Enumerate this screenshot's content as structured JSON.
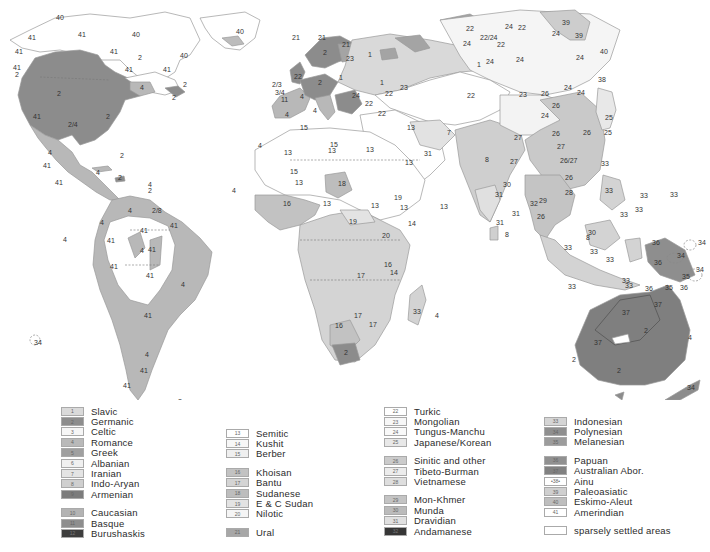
{
  "map": {
    "title": "World languages map",
    "colors": {
      "c1": "#d9d9d9",
      "c2": "#8c8c8c",
      "c3": "#f4f4f4",
      "c4": "#b8b8b8",
      "c5": "#9e9e9e",
      "c6": "#efefef",
      "c7": "#e2e2e2",
      "c8": "#cfcfcf",
      "c9": "#7a7a7a",
      "c10": "#b0b0b0",
      "c11": "#8a8a8a",
      "c12": "#3c3c3c",
      "white": "#ffffff",
      "light": "#e9e9e9",
      "mid": "#c6c6c6",
      "c21": "#a4a4a4",
      "c26": "#c9c9c9",
      "c32": "#353535",
      "c33": "#d3d3d3",
      "c34": "#8d8d8d",
      "c35": "#9a9a9a",
      "c36": "#8e8e8e",
      "c37": "#7f7f7f",
      "c39": "#cdcdcd",
      "c40": "#bcbcbc"
    },
    "labels": [
      {
        "t": "40",
        "x": 56,
        "y": 20
      },
      {
        "t": "41",
        "x": 28,
        "y": 40
      },
      {
        "t": "41",
        "x": 78,
        "y": 37
      },
      {
        "t": "40",
        "x": 132,
        "y": 37
      },
      {
        "t": "40",
        "x": 180,
        "y": 58
      },
      {
        "t": "41",
        "x": 110,
        "y": 54
      },
      {
        "t": "41",
        "x": 15,
        "y": 54
      },
      {
        "t": "41",
        "x": 125,
        "y": 72
      },
      {
        "t": "41",
        "x": 163,
        "y": 72
      },
      {
        "t": "2",
        "x": 138,
        "y": 60
      },
      {
        "t": "41",
        "x": 13,
        "y": 70
      },
      {
        "t": "2",
        "x": 15,
        "y": 77
      },
      {
        "t": "2",
        "x": 57,
        "y": 96
      },
      {
        "t": "4",
        "x": 140,
        "y": 90
      },
      {
        "t": "2",
        "x": 183,
        "y": 87
      },
      {
        "t": "2",
        "x": 172,
        "y": 100
      },
      {
        "t": "2",
        "x": 106,
        "y": 119
      },
      {
        "t": "41",
        "x": 33,
        "y": 119
      },
      {
        "t": "2/4",
        "x": 68,
        "y": 127
      },
      {
        "t": "4",
        "x": 48,
        "y": 155
      },
      {
        "t": "41",
        "x": 43,
        "y": 168
      },
      {
        "t": "41",
        "x": 55,
        "y": 185
      },
      {
        "t": "2",
        "x": 120,
        "y": 158
      },
      {
        "t": "4",
        "x": 96,
        "y": 175
      },
      {
        "t": "2",
        "x": 118,
        "y": 180
      },
      {
        "t": "4",
        "x": 148,
        "y": 187
      },
      {
        "t": "2",
        "x": 148,
        "y": 193
      },
      {
        "t": "40",
        "x": 236,
        "y": 34
      },
      {
        "t": "4",
        "x": 232,
        "y": 193
      },
      {
        "t": "4",
        "x": 128,
        "y": 213
      },
      {
        "t": "2/8",
        "x": 152,
        "y": 213
      },
      {
        "t": "41",
        "x": 170,
        "y": 228
      },
      {
        "t": "41",
        "x": 140,
        "y": 233
      },
      {
        "t": "4",
        "x": 100,
        "y": 225
      },
      {
        "t": "41",
        "x": 107,
        "y": 243
      },
      {
        "t": "4",
        "x": 140,
        "y": 253
      },
      {
        "t": "41",
        "x": 148,
        "y": 252
      },
      {
        "t": "41",
        "x": 110,
        "y": 269
      },
      {
        "t": "41",
        "x": 146,
        "y": 278
      },
      {
        "t": "4",
        "x": 181,
        "y": 287
      },
      {
        "t": "41",
        "x": 144,
        "y": 318
      },
      {
        "t": "4",
        "x": 145,
        "y": 357
      },
      {
        "t": "41",
        "x": 140,
        "y": 373
      },
      {
        "t": "41",
        "x": 123,
        "y": 388
      },
      {
        "t": "4",
        "x": 63,
        "y": 242
      },
      {
        "t": "34",
        "x": 34,
        "y": 345
      },
      {
        "t": "2",
        "x": 178,
        "y": 404
      },
      {
        "t": "21",
        "x": 318,
        "y": 40
      },
      {
        "t": "21",
        "x": 292,
        "y": 40
      },
      {
        "t": "2",
        "x": 323,
        "y": 55
      },
      {
        "t": "21",
        "x": 342,
        "y": 47
      },
      {
        "t": "23",
        "x": 346,
        "y": 61
      },
      {
        "t": "1",
        "x": 368,
        "y": 57
      },
      {
        "t": "22",
        "x": 294,
        "y": 79
      },
      {
        "t": "2",
        "x": 318,
        "y": 85
      },
      {
        "t": "1",
        "x": 339,
        "y": 80
      },
      {
        "t": "1",
        "x": 380,
        "y": 85
      },
      {
        "t": "2/3",
        "x": 272,
        "y": 87
      },
      {
        "t": "3/4",
        "x": 275,
        "y": 95
      },
      {
        "t": "4",
        "x": 300,
        "y": 99
      },
      {
        "t": "11",
        "x": 281,
        "y": 102
      },
      {
        "t": "4",
        "x": 285,
        "y": 117
      },
      {
        "t": "4",
        "x": 313,
        "y": 113
      },
      {
        "t": "24",
        "x": 352,
        "y": 98
      },
      {
        "t": "22",
        "x": 365,
        "y": 106
      },
      {
        "t": "22",
        "x": 385,
        "y": 96
      },
      {
        "t": "23",
        "x": 400,
        "y": 90
      },
      {
        "t": "22",
        "x": 378,
        "y": 116
      },
      {
        "t": "15",
        "x": 300,
        "y": 130
      },
      {
        "t": "15",
        "x": 330,
        "y": 147
      },
      {
        "t": "4",
        "x": 258,
        "y": 148
      },
      {
        "t": "13",
        "x": 284,
        "y": 155
      },
      {
        "t": "13",
        "x": 328,
        "y": 153
      },
      {
        "t": "13",
        "x": 366,
        "y": 152
      },
      {
        "t": "13",
        "x": 405,
        "y": 165
      },
      {
        "t": "18",
        "x": 338,
        "y": 186
      },
      {
        "t": "13",
        "x": 295,
        "y": 185
      },
      {
        "t": "15",
        "x": 290,
        "y": 174
      },
      {
        "t": "16",
        "x": 283,
        "y": 206
      },
      {
        "t": "13",
        "x": 323,
        "y": 206
      },
      {
        "t": "19",
        "x": 349,
        "y": 224
      },
      {
        "t": "19",
        "x": 394,
        "y": 200
      },
      {
        "t": "13",
        "x": 400,
        "y": 210
      },
      {
        "t": "13",
        "x": 371,
        "y": 208
      },
      {
        "t": "14",
        "x": 408,
        "y": 226
      },
      {
        "t": "20",
        "x": 382,
        "y": 238
      },
      {
        "t": "17",
        "x": 357,
        "y": 278
      },
      {
        "t": "16",
        "x": 384,
        "y": 267
      },
      {
        "t": "14",
        "x": 390,
        "y": 275
      },
      {
        "t": "17",
        "x": 354,
        "y": 318
      },
      {
        "t": "16",
        "x": 335,
        "y": 328
      },
      {
        "t": "17",
        "x": 369,
        "y": 327
      },
      {
        "t": "2",
        "x": 344,
        "y": 355
      },
      {
        "t": "33",
        "x": 413,
        "y": 314
      },
      {
        "t": "4",
        "x": 435,
        "y": 318
      },
      {
        "t": "13",
        "x": 407,
        "y": 130
      },
      {
        "t": "31",
        "x": 424,
        "y": 156
      },
      {
        "t": "7",
        "x": 447,
        "y": 135
      },
      {
        "t": "13",
        "x": 440,
        "y": 209
      },
      {
        "t": "8",
        "x": 485,
        "y": 162
      },
      {
        "t": "31",
        "x": 495,
        "y": 197
      },
      {
        "t": "30",
        "x": 503,
        "y": 187
      },
      {
        "t": "31",
        "x": 496,
        "y": 225
      },
      {
        "t": "8",
        "x": 505,
        "y": 237
      },
      {
        "t": "31",
        "x": 512,
        "y": 216
      },
      {
        "t": "32",
        "x": 530,
        "y": 206
      },
      {
        "t": "27",
        "x": 514,
        "y": 140
      },
      {
        "t": "22",
        "x": 467,
        "y": 98
      },
      {
        "t": "24",
        "x": 463,
        "y": 46
      },
      {
        "t": "22",
        "x": 466,
        "y": 31
      },
      {
        "t": "22/24",
        "x": 480,
        "y": 40
      },
      {
        "t": "22",
        "x": 497,
        "y": 47
      },
      {
        "t": "24",
        "x": 505,
        "y": 29
      },
      {
        "t": "22",
        "x": 518,
        "y": 30
      },
      {
        "t": "1",
        "x": 477,
        "y": 67
      },
      {
        "t": "24",
        "x": 486,
        "y": 64
      },
      {
        "t": "24",
        "x": 516,
        "y": 62
      },
      {
        "t": "23",
        "x": 519,
        "y": 97
      },
      {
        "t": "26",
        "x": 541,
        "y": 96
      },
      {
        "t": "24",
        "x": 541,
        "y": 118
      },
      {
        "t": "26",
        "x": 552,
        "y": 108
      },
      {
        "t": "24",
        "x": 564,
        "y": 90
      },
      {
        "t": "26",
        "x": 552,
        "y": 136
      },
      {
        "t": "27",
        "x": 557,
        "y": 149
      },
      {
        "t": "26/27",
        "x": 560,
        "y": 163
      },
      {
        "t": "26",
        "x": 583,
        "y": 135
      },
      {
        "t": "27",
        "x": 510,
        "y": 164
      },
      {
        "t": "28",
        "x": 565,
        "y": 195
      },
      {
        "t": "39",
        "x": 562,
        "y": 25
      },
      {
        "t": "39",
        "x": 575,
        "y": 38
      },
      {
        "t": "24",
        "x": 552,
        "y": 36
      },
      {
        "t": "40",
        "x": 600,
        "y": 54
      },
      {
        "t": "24",
        "x": 576,
        "y": 60
      },
      {
        "t": "38",
        "x": 598,
        "y": 82
      },
      {
        "t": "24",
        "x": 577,
        "y": 95
      },
      {
        "t": "25",
        "x": 605,
        "y": 120
      },
      {
        "t": "25",
        "x": 604,
        "y": 135
      },
      {
        "t": "33",
        "x": 601,
        "y": 166
      },
      {
        "t": "33",
        "x": 670,
        "y": 197
      },
      {
        "t": "33",
        "x": 640,
        "y": 198
      },
      {
        "t": "33",
        "x": 605,
        "y": 193
      },
      {
        "t": "33",
        "x": 620,
        "y": 217
      },
      {
        "t": "33",
        "x": 635,
        "y": 212
      },
      {
        "t": "33",
        "x": 590,
        "y": 254
      },
      {
        "t": "33",
        "x": 564,
        "y": 250
      },
      {
        "t": "33",
        "x": 568,
        "y": 289
      },
      {
        "t": "33",
        "x": 606,
        "y": 262
      },
      {
        "t": "33",
        "x": 622,
        "y": 283
      },
      {
        "t": "33",
        "x": 625,
        "y": 288
      },
      {
        "t": "34",
        "x": 698,
        "y": 245
      },
      {
        "t": "34",
        "x": 677,
        "y": 258
      },
      {
        "t": "34",
        "x": 696,
        "y": 272
      },
      {
        "t": "36",
        "x": 652,
        "y": 245
      },
      {
        "t": "36",
        "x": 654,
        "y": 265
      },
      {
        "t": "36",
        "x": 645,
        "y": 291
      },
      {
        "t": "35",
        "x": 665,
        "y": 290
      },
      {
        "t": "35",
        "x": 682,
        "y": 279
      },
      {
        "t": "36",
        "x": 680,
        "y": 290
      },
      {
        "t": "37",
        "x": 622,
        "y": 315
      },
      {
        "t": "37",
        "x": 654,
        "y": 307
      },
      {
        "t": "37",
        "x": 594,
        "y": 345
      },
      {
        "t": "2",
        "x": 644,
        "y": 333
      },
      {
        "t": "2",
        "x": 572,
        "y": 362
      },
      {
        "t": "2",
        "x": 617,
        "y": 373
      },
      {
        "t": "34",
        "x": 687,
        "y": 390
      },
      {
        "t": "4",
        "x": 688,
        "y": 340
      },
      {
        "t": "2",
        "x": 617,
        "y": 411
      },
      {
        "t": "8",
        "x": 586,
        "y": 240
      },
      {
        "t": "26",
        "x": 537,
        "y": 219
      },
      {
        "t": "29",
        "x": 539,
        "y": 203
      },
      {
        "t": "26",
        "x": 565,
        "y": 180
      },
      {
        "t": "30",
        "x": 588,
        "y": 235
      }
    ]
  },
  "legend": {
    "col1": [
      {
        "num": "1",
        "label": "Slavic",
        "color": "#dadada"
      },
      {
        "num": "2",
        "label": "Germanic",
        "color": "#8d8d8d"
      },
      {
        "num": "3",
        "label": "Celtic",
        "color": "#f6f6f6"
      },
      {
        "num": "4",
        "label": "Romance",
        "color": "#b9b9b9"
      },
      {
        "num": "5",
        "label": "Greek",
        "color": "#a0a0a0"
      },
      {
        "num": "6",
        "label": "Albanian",
        "color": "#f0f0f0"
      },
      {
        "num": "7",
        "label": "Iranian",
        "color": "#e4e4e4"
      },
      {
        "num": "8",
        "label": "Indo-Aryan",
        "color": "#cfcfcf"
      },
      {
        "num": "9",
        "label": "Armenian",
        "color": "#7c7c7c"
      }
    ],
    "col1b": [
      {
        "num": "10",
        "label": "Caucasian",
        "color": "#b3b3b3"
      },
      {
        "num": "11",
        "label": "Basque",
        "color": "#8e8e8e"
      },
      {
        "num": "12",
        "label": "Burushaskis",
        "color": "#3d3d3d"
      }
    ],
    "col2": [
      {
        "num": "13",
        "label": "Semitic",
        "color": "#ffffff"
      },
      {
        "num": "14",
        "label": "Kushit",
        "color": "#f7f7f7"
      },
      {
        "num": "15",
        "label": "Berber",
        "color": "#efefef"
      }
    ],
    "col2b": [
      {
        "num": "16",
        "label": "Khoisan",
        "color": "#c2c2c2"
      },
      {
        "num": "17",
        "label": "Bantu",
        "color": "#d4d4d4"
      },
      {
        "num": "18",
        "label": "Sudanese",
        "color": "#bdbdbd"
      },
      {
        "num": "19",
        "label": "E & C Sudan",
        "color": "#e3e3e3"
      },
      {
        "num": "20",
        "label": "Nilotic",
        "color": "#f5f5f5"
      }
    ],
    "col2c": [
      {
        "num": "21",
        "label": "Ural",
        "color": "#a7a7a7"
      }
    ],
    "col3": [
      {
        "num": "22",
        "label": "Turkic",
        "color": "#ffffff"
      },
      {
        "num": "23",
        "label": "Mongolian",
        "color": "#f7f7f7"
      },
      {
        "num": "24",
        "label": "Tungus-Manchu",
        "color": "#f9f9f9"
      },
      {
        "num": "25",
        "label": "Japanese/Korean",
        "color": "#e8e8e8"
      }
    ],
    "col3b": [
      {
        "num": "26",
        "label": "Sinitic and other",
        "color": "#cbcbcb"
      },
      {
        "num": "27",
        "label": "Tibeto-Burman",
        "color": "#ececec"
      },
      {
        "num": "28",
        "label": "Vietnamese",
        "color": "#dedede"
      }
    ],
    "col3c": [
      {
        "num": "29",
        "label": "Mon-Khmer",
        "color": "#c4c4c4"
      },
      {
        "num": "30",
        "label": "Munda",
        "color": "#bbbbbb"
      },
      {
        "num": "31",
        "label": "Dravidian",
        "color": "#e0e0e0"
      },
      {
        "num": "32",
        "label": "Andamanese",
        "color": "#363636"
      }
    ],
    "col4": [
      {
        "num": "33",
        "label": "Indonesian",
        "color": "#d5d5d5"
      },
      {
        "num": "34",
        "label": "Polynesian",
        "color": "#8f8f8f"
      },
      {
        "num": "35",
        "label": "Melanesian",
        "color": "#9c9c9c"
      }
    ],
    "col4b": [
      {
        "num": "36",
        "label": "Papuan",
        "color": "#909090"
      },
      {
        "num": "37",
        "label": "Australian   Abor.",
        "color": "#818181"
      },
      {
        "num": "•38•",
        "label": "Ainu",
        "color": "#ffffff"
      },
      {
        "num": "39",
        "label": "Paleoasiatic",
        "color": "#cfcfcf"
      },
      {
        "num": "40",
        "label": "Eskimo-Aleut",
        "color": "#bebebe"
      },
      {
        "num": "41",
        "label": "Amerindian",
        "color": "#ffffff"
      }
    ],
    "sparse": {
      "num": "",
      "label": "sparsely settled areas",
      "color": "#ffffff"
    }
  }
}
